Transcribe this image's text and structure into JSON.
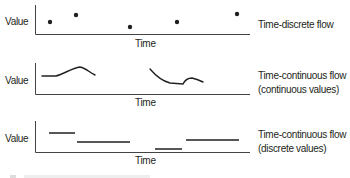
{
  "diagram": {
    "panels": [
      {
        "id": "time-discrete",
        "y_label": "Value",
        "x_label": "Time",
        "description": "Time-discrete flow",
        "description_lines": [
          "Time-discrete flow"
        ],
        "marks": "dots",
        "points": [
          [
            50,
            22
          ],
          [
            76,
            15
          ],
          [
            130,
            27
          ],
          [
            177,
            22
          ],
          [
            237,
            14
          ]
        ]
      },
      {
        "id": "time-continuous-continuous",
        "y_label": "Value",
        "x_label": "Time",
        "description_lines": [
          "Time-continuous flow",
          "(continuous values)"
        ],
        "marks": "curves"
      },
      {
        "id": "time-continuous-discrete",
        "y_label": "Value",
        "x_label": "Time",
        "description_lines": [
          "Time-continuous flow",
          "(discrete values)"
        ],
        "marks": "step-segments"
      }
    ],
    "colors": {
      "ink": "#231f20",
      "axis": "#555555"
    }
  }
}
